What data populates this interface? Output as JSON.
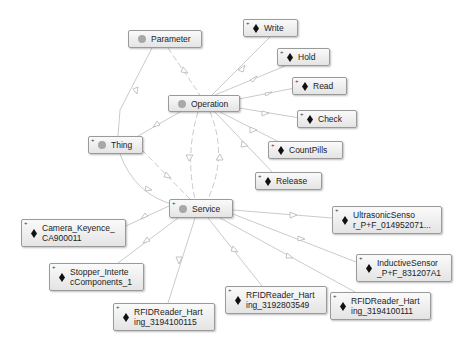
{
  "diagram": {
    "type": "ontology-graph",
    "classes": [
      {
        "id": "parameter",
        "label": "Parameter",
        "expandable": false
      },
      {
        "id": "operation",
        "label": "Operation",
        "expandable": false
      },
      {
        "id": "thing",
        "label": "Thing",
        "expandable": true
      },
      {
        "id": "service",
        "label": "Service",
        "expandable": true
      }
    ],
    "individuals": [
      {
        "id": "write",
        "label": "Write"
      },
      {
        "id": "hold",
        "label": "Hold"
      },
      {
        "id": "read",
        "label": "Read"
      },
      {
        "id": "check",
        "label": "Check"
      },
      {
        "id": "countpills",
        "label": "CountPills"
      },
      {
        "id": "release",
        "label": "Release"
      },
      {
        "id": "camera",
        "label": "Camera_Keyence_\nCA900011"
      },
      {
        "id": "stopper",
        "label": "Stopper_Interte\ncComponents_1"
      },
      {
        "id": "rfid115",
        "label": "RFIDReader_Hart\ning_3194100115"
      },
      {
        "id": "rfid549",
        "label": "RFIDReader_Hart\ning_3192803549"
      },
      {
        "id": "rfid111",
        "label": "RFIDReader_Hart\ning_3194100111"
      },
      {
        "id": "ultrasonic",
        "label": "UltrasonicSenso\nr_P+F_014952071..."
      },
      {
        "id": "inductive",
        "label": "InductiveSensor\n_P+F_831207A1"
      }
    ],
    "edges": [
      {
        "from": "operation",
        "to": "write",
        "style": "solid"
      },
      {
        "from": "operation",
        "to": "hold",
        "style": "solid"
      },
      {
        "from": "operation",
        "to": "read",
        "style": "solid"
      },
      {
        "from": "operation",
        "to": "check",
        "style": "solid"
      },
      {
        "from": "operation",
        "to": "countpills",
        "style": "solid"
      },
      {
        "from": "operation",
        "to": "release",
        "style": "solid"
      },
      {
        "from": "parameter",
        "to": "operation",
        "style": "dashed"
      },
      {
        "from": "parameter",
        "to": "thing",
        "style": "solid"
      },
      {
        "from": "operation",
        "to": "thing",
        "style": "solid"
      },
      {
        "from": "thing",
        "to": "service",
        "style": "solid"
      },
      {
        "from": "thing",
        "to": "service",
        "style": "dashed"
      },
      {
        "from": "operation",
        "to": "service",
        "style": "dashed"
      },
      {
        "from": "service",
        "to": "operation",
        "style": "dashed"
      },
      {
        "from": "service",
        "to": "camera",
        "style": "solid"
      },
      {
        "from": "service",
        "to": "stopper",
        "style": "solid"
      },
      {
        "from": "service",
        "to": "rfid115",
        "style": "solid"
      },
      {
        "from": "service",
        "to": "rfid549",
        "style": "solid"
      },
      {
        "from": "service",
        "to": "rfid111",
        "style": "solid"
      },
      {
        "from": "service",
        "to": "ultrasonic",
        "style": "solid"
      },
      {
        "from": "service",
        "to": "inductive",
        "style": "solid"
      }
    ],
    "colors": {
      "edge": "#bdbdbd",
      "node_border": "#9a9a9a",
      "class_dot": "#a8a8a8",
      "individual_diamond": "#111111"
    }
  }
}
